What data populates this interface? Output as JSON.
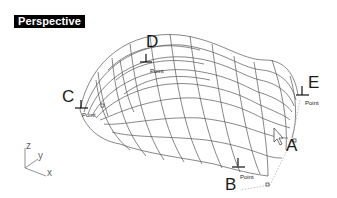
{
  "viewport": {
    "title": "Perspective",
    "background": "#ffffff",
    "wire_color": "#555555"
  },
  "labels": {
    "A": "A",
    "B": "B",
    "C": "C",
    "D": "D",
    "E": "E"
  },
  "point_objects": [
    {
      "id": "C",
      "text": "Point"
    },
    {
      "id": "D",
      "text": "Point"
    },
    {
      "id": "E",
      "text": "Point"
    },
    {
      "id": "B",
      "text": "Point"
    }
  ],
  "axis_gizmo": {
    "z": "z",
    "y": "y",
    "x": "x"
  },
  "cursor": {
    "icon": "arrow-pointer-icon"
  }
}
